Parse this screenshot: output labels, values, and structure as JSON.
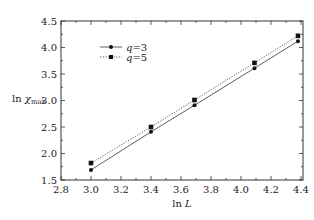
{
  "chart_data": {
    "type": "line",
    "title": "",
    "xlabel": "ln L",
    "ylabel": "ln χmax",
    "xlim": [
      2.8,
      4.45
    ],
    "ylim": [
      1.5,
      4.5
    ],
    "xticks": [
      "2.8",
      "3.0",
      "3.2",
      "3.4",
      "3.6",
      "3.8",
      "4.0",
      "4.2",
      "4.4"
    ],
    "yticks": [
      "1.5",
      "2.0",
      "2.5",
      "3.0",
      "3.5",
      "4.0",
      "4.5"
    ],
    "grid": false,
    "legend_position": "upper left",
    "series": [
      {
        "name": "q=3",
        "marker": "circle",
        "line_style": "solid",
        "x": [
          3.0,
          3.4,
          3.69,
          4.09,
          4.38
        ],
        "y": [
          1.69,
          2.41,
          2.91,
          3.61,
          4.12
        ]
      },
      {
        "name": "q=5",
        "marker": "square",
        "line_style": "dotted",
        "x": [
          3.0,
          3.4,
          3.69,
          4.09,
          4.38
        ],
        "y": [
          1.82,
          2.5,
          3.01,
          3.71,
          4.22
        ]
      }
    ]
  },
  "axes": {
    "xlabel_main": "ln",
    "xlabel_var": "L",
    "ylabel_main": "ln",
    "ylabel_var": "χ",
    "ylabel_sub": "max"
  },
  "legend": {
    "items": [
      {
        "var": "q",
        "eq": "=3"
      },
      {
        "var": "q",
        "eq": "=5"
      }
    ]
  },
  "colors": {
    "line": "#333333",
    "frame": "#333333",
    "background": "#ffffff"
  }
}
